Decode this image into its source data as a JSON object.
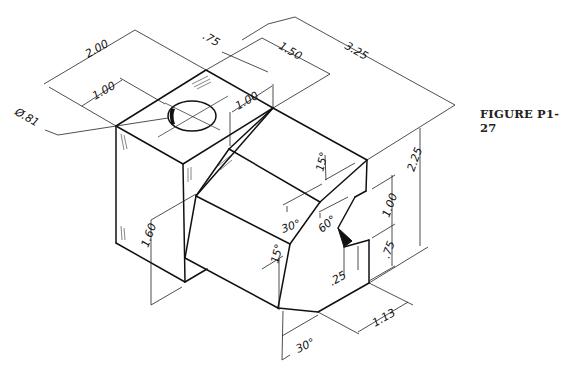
{
  "figure": {
    "caption": "FIGURE P1-27",
    "type": "isometric technical drawing of machined block"
  },
  "dimensions": {
    "overall_width": "2.00",
    "hole_offset": "1.00",
    "hole_diameter": "Ø.81",
    "hole_side_offset": ".75",
    "slot_width": "1.50",
    "overall_length": "3.25",
    "chamfer_offset": "1.00",
    "overall_height": "2.25",
    "lower_height": "1.60",
    "notch_upper": "1.00",
    "notch_lower": ".75",
    "notch_depth": ".25",
    "bottom_offset": "1.13",
    "angle_top": "15°",
    "angle_30_upper": "30°",
    "angle_60": "60°",
    "angle_15_lower": "15°",
    "angle_30_bottom": "30°"
  }
}
